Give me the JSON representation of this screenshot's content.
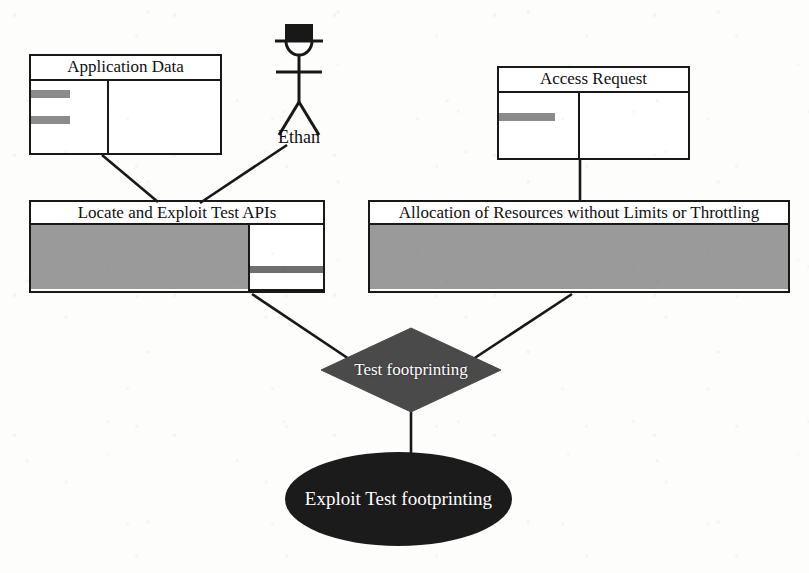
{
  "diagram": {
    "kind": "uml-use-case-diagram",
    "background_color": "#fdfdfb",
    "line_color": "#181818",
    "fill_gray": "#9a9a9a",
    "fill_dark": "#4a4a4a",
    "fill_black": "#1b1b1b"
  },
  "classes": [
    {
      "id": "application-data",
      "title": "Application Data",
      "attribute_bars": 2,
      "x": 29,
      "y": 54,
      "width": 193,
      "height": 101
    },
    {
      "id": "access-request",
      "title": "Access Request",
      "attribute_bars": 1,
      "x": 497,
      "y": 66,
      "width": 193,
      "height": 94
    }
  ],
  "use_cases": [
    {
      "id": "locate-exploit-test-apis",
      "title": "Locate and Exploit Test APIs",
      "x": 29,
      "y": 200,
      "width": 296,
      "height": 93,
      "has_subpanel": true
    },
    {
      "id": "allocation-of-resources",
      "title": "Allocation of Resources without Limits or Throttling",
      "x": 368,
      "y": 200,
      "width": 422,
      "height": 93,
      "has_subpanel": false
    }
  ],
  "actor": {
    "id": "ethan",
    "label": "Ethan",
    "wears_hat": true,
    "x": 268,
    "y": 22
  },
  "decision": {
    "id": "test-footprinting",
    "label": "Test footprinting",
    "shape": "diamond",
    "x": 320,
    "y": 327,
    "width": 182,
    "height": 86
  },
  "outcome": {
    "id": "exploit-test-footprinting",
    "label": "Exploit Test footprinting",
    "shape": "ellipse",
    "x": 285,
    "y": 452,
    "width": 227,
    "height": 94
  },
  "connectors": [
    {
      "from": "application-data",
      "to": "locate-exploit-test-apis"
    },
    {
      "from": "ethan",
      "to": "locate-exploit-test-apis"
    },
    {
      "from": "access-request",
      "to": "allocation-of-resources"
    },
    {
      "from": "locate-exploit-test-apis",
      "to": "test-footprinting"
    },
    {
      "from": "allocation-of-resources",
      "to": "test-footprinting"
    },
    {
      "from": "test-footprinting",
      "to": "exploit-test-footprinting"
    }
  ]
}
